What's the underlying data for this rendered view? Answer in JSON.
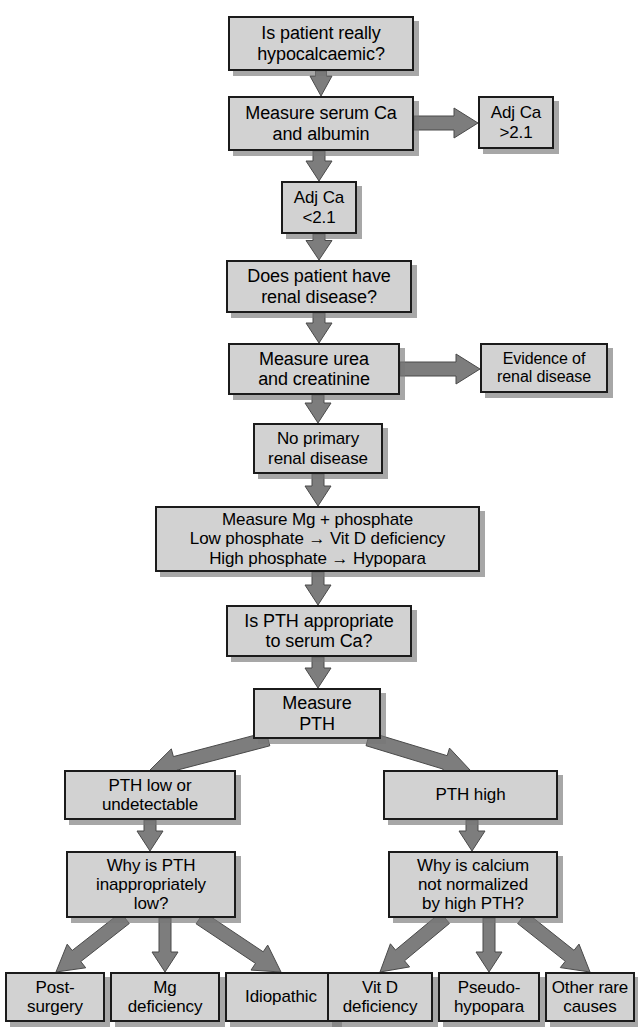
{
  "diagram": {
    "colors": {
      "box_fill": "#d2d2d2",
      "box_border": "#1b1b1b",
      "arrow": "#7d7d7d",
      "arrow_outline": "#4a4a4a",
      "shadow": "#787878",
      "background": "#ffffff",
      "text": "#000000"
    },
    "nodes": [
      {
        "id": "is-patient-hypocalcaemic",
        "text": "Is patient really\nhypocalcaemic?",
        "x": 228,
        "y": 16,
        "w": 186,
        "h": 55,
        "font": 18
      },
      {
        "id": "measure-serum-ca-albumin",
        "text": "Measure serum Ca\nand albumin",
        "x": 228,
        "y": 96,
        "w": 186,
        "h": 55,
        "font": 18
      },
      {
        "id": "adj-ca-high",
        "text": "Adj Ca\n>2.1",
        "x": 478,
        "y": 96,
        "w": 76,
        "h": 53,
        "font": 17
      },
      {
        "id": "adj-ca-low",
        "text": "Adj Ca\n<2.1",
        "x": 281,
        "y": 181,
        "w": 76,
        "h": 53,
        "font": 17
      },
      {
        "id": "does-patient-have-renal-disease",
        "text": "Does patient have\nrenal disease?",
        "x": 226,
        "y": 260,
        "w": 186,
        "h": 53,
        "font": 18
      },
      {
        "id": "measure-urea-creatinine",
        "text": "Measure urea\nand creatinine",
        "x": 228,
        "y": 343,
        "w": 172,
        "h": 52,
        "font": 18
      },
      {
        "id": "evidence-of-renal-disease",
        "text": "Evidence of\nrenal disease",
        "x": 480,
        "y": 343,
        "w": 128,
        "h": 50,
        "font": 16
      },
      {
        "id": "no-primary-renal-disease",
        "text": "No primary\nrenal disease",
        "x": 253,
        "y": 423,
        "w": 130,
        "h": 51,
        "font": 17
      },
      {
        "id": "measure-mg-phosphate",
        "text": "Measure Mg + phosphate\nLow phosphate → Vit D deficiency\nHigh phosphate  → Hypopara",
        "x": 155,
        "y": 506,
        "w": 325,
        "h": 66,
        "font": 17
      },
      {
        "id": "is-pth-appropriate",
        "text": "Is PTH appropriate\nto serum Ca?",
        "x": 226,
        "y": 605,
        "w": 186,
        "h": 52,
        "font": 18
      },
      {
        "id": "measure-pth",
        "text": "Measure\nPTH",
        "x": 253,
        "y": 688,
        "w": 128,
        "h": 51,
        "font": 18
      },
      {
        "id": "pth-low-or-undetectable",
        "text": "PTH low or\nundetectable",
        "x": 64,
        "y": 770,
        "w": 172,
        "h": 50,
        "font": 17
      },
      {
        "id": "pth-high",
        "text": "PTH high",
        "x": 383,
        "y": 770,
        "w": 175,
        "h": 50,
        "font": 17
      },
      {
        "id": "why-is-pth-inappropriately-low",
        "text": "Why is PTH\ninappropriately\nlow?",
        "x": 66,
        "y": 851,
        "w": 170,
        "h": 67,
        "font": 17
      },
      {
        "id": "why-is-calcium-not-normalized",
        "text": "Why is calcium\nnot normalized\nby high PTH?",
        "x": 388,
        "y": 851,
        "w": 170,
        "h": 67,
        "font": 17
      },
      {
        "id": "post-surgery",
        "text": "Post-\nsurgery",
        "x": 5,
        "y": 972,
        "w": 100,
        "h": 50,
        "font": 17
      },
      {
        "id": "mg-deficiency",
        "text": "Mg\ndeficiency",
        "x": 110,
        "y": 972,
        "w": 110,
        "h": 50,
        "font": 17
      },
      {
        "id": "idiopathic",
        "text": "Idiopathic",
        "x": 225,
        "y": 972,
        "w": 112,
        "h": 50,
        "font": 17
      },
      {
        "id": "vit-d-deficiency",
        "text": "Vit D\ndeficiency",
        "x": 327,
        "y": 972,
        "w": 106,
        "h": 50,
        "font": 17
      },
      {
        "id": "pseudo-hypopara",
        "text": "Pseudo-\nhypopara",
        "x": 438,
        "y": 972,
        "w": 102,
        "h": 50,
        "font": 17
      },
      {
        "id": "other-rare-causes",
        "text": "Other rare\ncauses",
        "x": 545,
        "y": 972,
        "w": 90,
        "h": 50,
        "font": 17
      }
    ],
    "edges": [
      {
        "id": "e1",
        "from": "is-patient-hypocalcaemic",
        "to": "measure-serum-ca-albumin",
        "kind": "down",
        "x1": 321,
        "y1": 71,
        "x2": 321,
        "y2": 96
      },
      {
        "id": "e2",
        "from": "measure-serum-ca-albumin",
        "to": "adj-ca-high",
        "kind": "right",
        "x1": 414,
        "y1": 123,
        "x2": 478,
        "y2": 123
      },
      {
        "id": "e3",
        "from": "measure-serum-ca-albumin",
        "to": "adj-ca-low",
        "kind": "down",
        "x1": 319,
        "y1": 151,
        "x2": 319,
        "y2": 181
      },
      {
        "id": "e4",
        "from": "adj-ca-low",
        "to": "does-patient-have-renal-disease",
        "kind": "down",
        "x1": 319,
        "y1": 234,
        "x2": 319,
        "y2": 260
      },
      {
        "id": "e5",
        "from": "does-patient-have-renal-disease",
        "to": "measure-urea-creatinine",
        "kind": "down",
        "x1": 319,
        "y1": 313,
        "x2": 319,
        "y2": 343
      },
      {
        "id": "e6",
        "from": "measure-urea-creatinine",
        "to": "evidence-of-renal-disease",
        "kind": "right",
        "x1": 400,
        "y1": 369,
        "x2": 480,
        "y2": 369
      },
      {
        "id": "e7",
        "from": "measure-urea-creatinine",
        "to": "no-primary-renal-disease",
        "kind": "down",
        "x1": 318,
        "y1": 395,
        "x2": 318,
        "y2": 423
      },
      {
        "id": "e8",
        "from": "no-primary-renal-disease",
        "to": "measure-mg-phosphate",
        "kind": "down",
        "x1": 318,
        "y1": 474,
        "x2": 318,
        "y2": 506
      },
      {
        "id": "e9",
        "from": "measure-mg-phosphate",
        "to": "is-pth-appropriate",
        "kind": "down",
        "x1": 318,
        "y1": 572,
        "x2": 318,
        "y2": 605
      },
      {
        "id": "e10",
        "from": "is-pth-appropriate",
        "to": "measure-pth",
        "kind": "down",
        "x1": 318,
        "y1": 657,
        "x2": 318,
        "y2": 688
      },
      {
        "id": "e11",
        "from": "measure-pth",
        "to": "pth-low-or-undetectable",
        "kind": "diag-left",
        "x1": 268,
        "y1": 739,
        "x2": 150,
        "y2": 770
      },
      {
        "id": "e12",
        "from": "measure-pth",
        "to": "pth-high",
        "kind": "diag-right",
        "x1": 368,
        "y1": 739,
        "x2": 470,
        "y2": 770
      },
      {
        "id": "e13",
        "from": "pth-low-or-undetectable",
        "to": "why-is-pth-inappropriately-low",
        "kind": "down",
        "x1": 150,
        "y1": 820,
        "x2": 150,
        "y2": 851
      },
      {
        "id": "e14",
        "from": "pth-high",
        "to": "why-is-calcium-not-normalized",
        "kind": "down",
        "x1": 472,
        "y1": 820,
        "x2": 472,
        "y2": 851
      },
      {
        "id": "e15",
        "from": "why-is-pth-inappropriately-low",
        "to": "post-surgery",
        "kind": "diag-left",
        "x1": 125,
        "y1": 918,
        "x2": 56,
        "y2": 972
      },
      {
        "id": "e16",
        "from": "why-is-pth-inappropriately-low",
        "to": "mg-deficiency",
        "kind": "down",
        "x1": 165,
        "y1": 918,
        "x2": 165,
        "y2": 972
      },
      {
        "id": "e17",
        "from": "why-is-pth-inappropriately-low",
        "to": "idiopathic",
        "kind": "diag-right",
        "x1": 200,
        "y1": 918,
        "x2": 281,
        "y2": 972
      },
      {
        "id": "e18",
        "from": "why-is-calcium-not-normalized",
        "to": "vit-d-deficiency",
        "kind": "diag-left",
        "x1": 445,
        "y1": 918,
        "x2": 380,
        "y2": 972
      },
      {
        "id": "e19",
        "from": "why-is-calcium-not-normalized",
        "to": "pseudo-hypopara",
        "kind": "down",
        "x1": 489,
        "y1": 918,
        "x2": 489,
        "y2": 972
      },
      {
        "id": "e20",
        "from": "why-is-calcium-not-normalized",
        "to": "other-rare-causes",
        "kind": "diag-right",
        "x1": 522,
        "y1": 918,
        "x2": 590,
        "y2": 972
      }
    ]
  }
}
